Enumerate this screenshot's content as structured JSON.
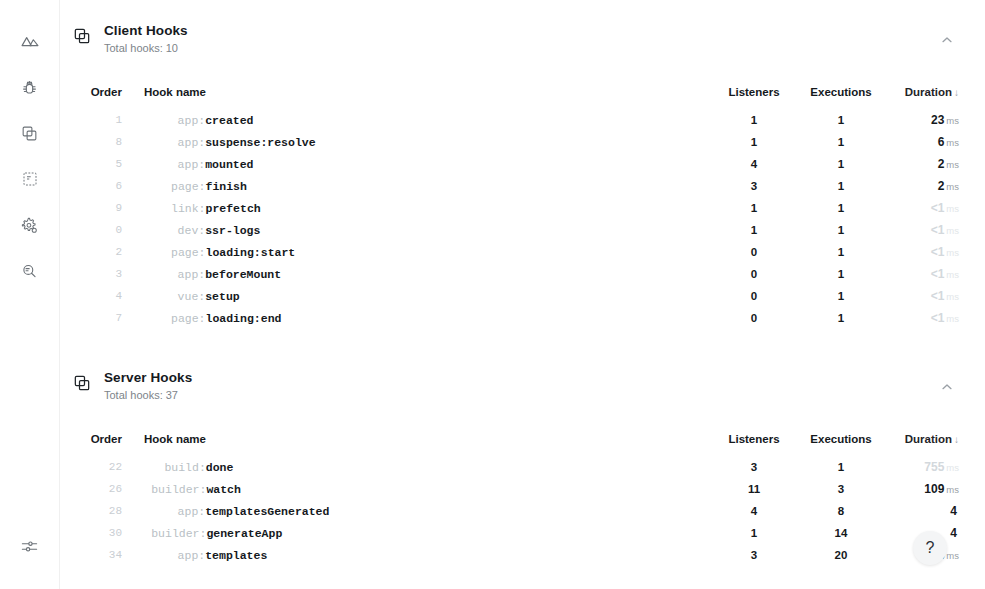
{
  "sidebar": {
    "items": [
      {
        "icon": "nuxt-logo-icon",
        "name": "sidebar-item-overview"
      },
      {
        "icon": "bug-icon",
        "name": "sidebar-item-debug"
      },
      {
        "icon": "hooks-icon",
        "name": "sidebar-item-hooks"
      },
      {
        "icon": "page-icon",
        "name": "sidebar-item-pages"
      },
      {
        "icon": "gear-icon",
        "name": "sidebar-item-settings"
      },
      {
        "icon": "search-icon",
        "name": "sidebar-item-search"
      }
    ],
    "bottom": {
      "icon": "sliders-icon",
      "name": "sidebar-item-preferences"
    }
  },
  "help": {
    "label": "?"
  },
  "columns": {
    "order": "Order",
    "hook_name": "Hook name",
    "listeners": "Listeners",
    "executions": "Executions",
    "duration": "Duration",
    "sort_arrow": "↓"
  },
  "sections": [
    {
      "id": "client-hooks",
      "title": "Client Hooks",
      "subtitle": "Total hooks: 10",
      "collapse_icon": "chevron-up-icon",
      "rows": [
        {
          "order": "1",
          "prefix": "app:",
          "name": "created",
          "listeners": "1",
          "executions": "1",
          "duration": "23",
          "unit": "ms",
          "muted": false
        },
        {
          "order": "8",
          "prefix": "app:",
          "name": "suspense:resolve",
          "listeners": "1",
          "executions": "1",
          "duration": "6",
          "unit": "ms",
          "muted": false
        },
        {
          "order": "5",
          "prefix": "app:",
          "name": "mounted",
          "listeners": "4",
          "executions": "1",
          "duration": "2",
          "unit": "ms",
          "muted": false
        },
        {
          "order": "6",
          "prefix": "page:",
          "name": "finish",
          "listeners": "3",
          "executions": "1",
          "duration": "2",
          "unit": "ms",
          "muted": false
        },
        {
          "order": "9",
          "prefix": "link:",
          "name": "prefetch",
          "listeners": "1",
          "executions": "1",
          "duration": "<1",
          "unit": "ms",
          "muted": true
        },
        {
          "order": "0",
          "prefix": "dev:",
          "name": "ssr-logs",
          "listeners": "1",
          "executions": "1",
          "duration": "<1",
          "unit": "ms",
          "muted": true
        },
        {
          "order": "2",
          "prefix": "page:",
          "name": "loading:start",
          "listeners": "0",
          "executions": "1",
          "duration": "<1",
          "unit": "ms",
          "muted": true
        },
        {
          "order": "3",
          "prefix": "app:",
          "name": "beforeMount",
          "listeners": "0",
          "executions": "1",
          "duration": "<1",
          "unit": "ms",
          "muted": true
        },
        {
          "order": "4",
          "prefix": "vue:",
          "name": "setup",
          "listeners": "0",
          "executions": "1",
          "duration": "<1",
          "unit": "ms",
          "muted": true
        },
        {
          "order": "7",
          "prefix": "page:",
          "name": "loading:end",
          "listeners": "0",
          "executions": "1",
          "duration": "<1",
          "unit": "ms",
          "muted": true
        }
      ]
    },
    {
      "id": "server-hooks",
      "title": "Server Hooks",
      "subtitle": "Total hooks: 37",
      "collapse_icon": "chevron-up-icon",
      "rows": [
        {
          "order": "22",
          "prefix": "build:",
          "name": "done",
          "listeners": "3",
          "executions": "1",
          "duration": "755",
          "unit": "ms",
          "muted": true
        },
        {
          "order": "26",
          "prefix": "builder:",
          "name": "watch",
          "listeners": "11",
          "executions": "3",
          "duration": "109",
          "unit": "ms",
          "muted": false
        },
        {
          "order": "28",
          "prefix": "app:",
          "name": "templatesGenerated",
          "listeners": "4",
          "executions": "8",
          "duration": "4",
          "unit": "",
          "muted": false
        },
        {
          "order": "30",
          "prefix": "builder:",
          "name": "generateApp",
          "listeners": "1",
          "executions": "14",
          "duration": "4",
          "unit": "",
          "muted": false
        },
        {
          "order": "34",
          "prefix": "app:",
          "name": "templates",
          "listeners": "3",
          "executions": "20",
          "duration": "8",
          "unit": "ms",
          "muted": false
        }
      ]
    }
  ]
}
